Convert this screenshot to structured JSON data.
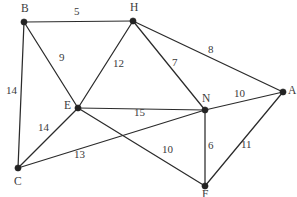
{
  "figure": {
    "background_color": "#ffffff",
    "edge_color": "#2b2b2b",
    "node_color": "#232323",
    "label_color": "#3a3a3a",
    "width": 297,
    "height": 197
  },
  "chart_data": {
    "type": "diagram",
    "title": "",
    "xlabel": "",
    "ylabel": "",
    "grid": false,
    "legend": "none",
    "nodes": [
      {
        "id": "B",
        "label": "B",
        "x": 24,
        "y": 22,
        "label_x": 21,
        "label_y": 3
      },
      {
        "id": "H",
        "label": "H",
        "x": 133,
        "y": 21,
        "label_x": 130,
        "label_y": 2
      },
      {
        "id": "A",
        "label": "A",
        "x": 283,
        "y": 92,
        "label_x": 288,
        "label_y": 85
      },
      {
        "id": "E",
        "label": "E",
        "x": 78,
        "y": 108,
        "label_x": 64,
        "label_y": 100
      },
      {
        "id": "N",
        "label": "N",
        "x": 205,
        "y": 110,
        "label_x": 202,
        "label_y": 93
      },
      {
        "id": "C",
        "label": "C",
        "x": 18,
        "y": 168,
        "label_x": 14,
        "label_y": 176
      },
      {
        "id": "F",
        "label": "F",
        "x": 205,
        "y": 186,
        "label_x": 202,
        "label_y": 189
      }
    ],
    "edges": [
      {
        "from": "B",
        "to": "H",
        "weight": 5,
        "label_x": 74,
        "label_y": 6
      },
      {
        "from": "B",
        "to": "C",
        "weight": 14,
        "label_x": 6,
        "label_y": 85
      },
      {
        "from": "B",
        "to": "E",
        "weight": 9,
        "label_x": 59,
        "label_y": 52
      },
      {
        "from": "H",
        "to": "E",
        "weight": 12,
        "label_x": 113,
        "label_y": 58
      },
      {
        "from": "H",
        "to": "N",
        "weight": 7,
        "label_x": 172,
        "label_y": 57
      },
      {
        "from": "H",
        "to": "A",
        "weight": 8,
        "label_x": 208,
        "label_y": 44
      },
      {
        "from": "E",
        "to": "N",
        "weight": 15,
        "label_x": 134,
        "label_y": 107
      },
      {
        "from": "E",
        "to": "C",
        "weight": 14,
        "label_x": 38,
        "label_y": 122
      },
      {
        "from": "E",
        "to": "F",
        "weight": 10,
        "label_x": 162,
        "label_y": 144
      },
      {
        "from": "C",
        "to": "N",
        "weight": 13,
        "label_x": 74,
        "label_y": 149
      },
      {
        "from": "N",
        "to": "A",
        "weight": 10,
        "label_x": 234,
        "label_y": 88
      },
      {
        "from": "N",
        "to": "F",
        "weight": 6,
        "label_x": 208,
        "label_y": 140
      },
      {
        "from": "F",
        "to": "A",
        "weight": 11,
        "label_x": 241,
        "label_y": 139
      }
    ],
    "node_radius": 3.1
  }
}
